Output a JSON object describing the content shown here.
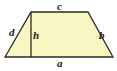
{
  "figure": {
    "name": "trapezoid-diagram",
    "type": "geometry-figure",
    "shape": "trapezoid",
    "canvas": {
      "width": 117,
      "height": 71
    },
    "colors": {
      "background": "#ffffff",
      "fill": "#f8f6c2",
      "stroke": "#2b2b24",
      "label_text": "#1a1a1a"
    },
    "stroke_width": 1.3,
    "vertices": {
      "bottom_left": {
        "x": 5,
        "y": 57
      },
      "bottom_right": {
        "x": 113,
        "y": 57
      },
      "top_right": {
        "x": 88,
        "y": 12
      },
      "top_left": {
        "x": 31,
        "y": 12
      }
    },
    "polygon_points": "5,57 113,57 88,12 31,12",
    "height_segment": {
      "x1": 31,
      "y1": 12,
      "x2": 31,
      "y2": 57
    }
  },
  "labels": {
    "top_side": {
      "text": "c",
      "x": 57,
      "y": 1,
      "side": "top"
    },
    "left_side": {
      "text": "d",
      "x": 9,
      "y": 27,
      "side": "left-leg"
    },
    "height": {
      "text": "h",
      "x": 33,
      "y": 30,
      "side": "altitude"
    },
    "right_side": {
      "text": "b",
      "x": 99,
      "y": 30,
      "side": "right-leg"
    },
    "bottom_side": {
      "text": "a",
      "x": 57,
      "y": 58,
      "side": "base"
    }
  }
}
